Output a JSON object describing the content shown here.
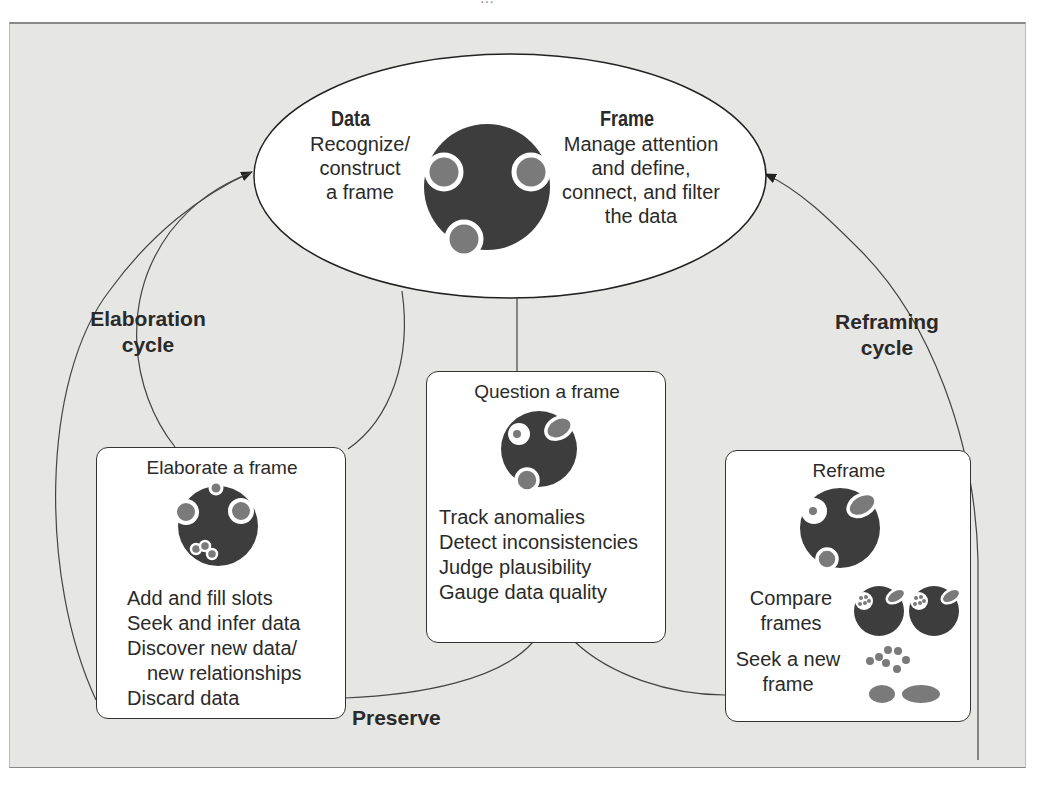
{
  "header": {
    "running_title_partial": "…"
  },
  "ellipse": {
    "data_title": "Data",
    "data_text": [
      "Recognize/",
      "construct",
      "a frame"
    ],
    "frame_title": "Frame",
    "frame_text": [
      "Manage attention",
      "and define,",
      "connect, and filter",
      "the data"
    ]
  },
  "cycles": {
    "elaboration": [
      "Elaboration",
      "cycle"
    ],
    "reframing": [
      "Reframing",
      "cycle"
    ],
    "preserve": "Preserve"
  },
  "boxes": {
    "elaborate": {
      "title": "Elaborate a frame",
      "items": [
        "Add and fill slots",
        "Seek and infer data",
        "Discover new data/",
        "new relationships",
        "Discard data"
      ]
    },
    "question": {
      "title": "Question a frame",
      "items": [
        "Track anomalies",
        "Detect inconsistencies",
        "Judge plausibility",
        "Gauge data quality"
      ]
    },
    "reframe": {
      "title": "Reframe",
      "compare": [
        "Compare",
        "frames"
      ],
      "seek": [
        "Seek a new",
        "frame"
      ]
    }
  },
  "colors": {
    "background": "#e6e6e4",
    "frame_dark": "#3d3d3d",
    "data_gray": "#7a7a7a",
    "line": "#444444",
    "box_fill": "#ffffff"
  },
  "icons": [
    "frame-icon",
    "elaborated-frame-icon",
    "questioned-frame-icon",
    "reframe-icon",
    "compare-frames-icon",
    "scattered-data-icon"
  ]
}
